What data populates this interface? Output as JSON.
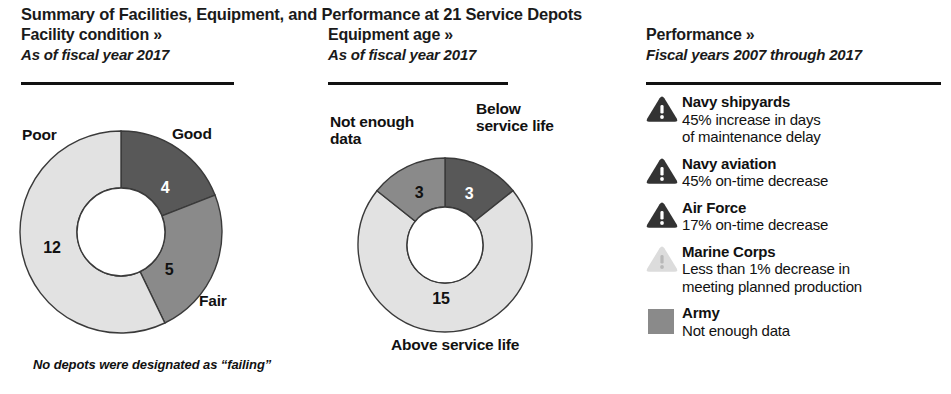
{
  "title": "Summary of Facilities, Equipment, and Performance at 21 Service Depots",
  "colors": {
    "dark": "#585858",
    "medium": "#8a8a8a",
    "light": "#e2e2e2",
    "stroke": "#3a3a3a",
    "icon_dark": "#333333",
    "icon_light": "#dcdcdc",
    "rule": "#111111",
    "text": "#111111"
  },
  "columns": {
    "facility": {
      "title": "Facility condition »",
      "subtitle": "As of fiscal year 2017",
      "footnote": "No depots were designated as “failing”"
    },
    "equipment": {
      "title": "Equipment age »",
      "subtitle": "As of fiscal year 2017"
    },
    "performance": {
      "title": "Performance »",
      "subtitle": "Fiscal years 2007 through 2017"
    }
  },
  "chart_data": [
    {
      "type": "pie",
      "id": "facility-condition",
      "title": "Facility condition »",
      "subtitle": "As of fiscal year 2017",
      "total": 21,
      "unit": "depots",
      "donut": true,
      "labels": [
        "Good",
        "Fair",
        "Poor"
      ],
      "values": [
        4,
        5,
        12
      ],
      "colors": [
        "#585858",
        "#8a8a8a",
        "#e2e2e2"
      ],
      "label_positions": [
        "top-right",
        "bottom-right",
        "top-left"
      ],
      "note": "No depots were designated as “failing”"
    },
    {
      "type": "pie",
      "id": "equipment-age",
      "title": "Equipment age »",
      "subtitle": "As of fiscal year 2017",
      "total": 21,
      "unit": "depots",
      "donut": true,
      "labels": [
        "Below service life",
        "Above service life",
        "Not enough data"
      ],
      "values": [
        3,
        15,
        3
      ],
      "colors": [
        "#585858",
        "#e2e2e2",
        "#8a8a8a"
      ],
      "label_positions": [
        "top-right",
        "bottom",
        "top-left"
      ]
    }
  ],
  "facility_slices": {
    "good": {
      "label": "Good",
      "value": "4"
    },
    "fair": {
      "label": "Fair",
      "value": "5"
    },
    "poor": {
      "label": "Poor",
      "value": "12"
    }
  },
  "equipment_slices": {
    "below": {
      "label": "Below<br>service life",
      "line1": "Below",
      "line2": "service life",
      "value": "3"
    },
    "above": {
      "label": "Above service life",
      "value": "15"
    },
    "notenough": {
      "line1": "Not enough",
      "line2": "data",
      "value": "3"
    }
  },
  "performance_items": [
    {
      "name": "Navy shipyards",
      "desc_line1": "45% increase in days",
      "desc_line2": "of maintenance delay",
      "icon": "warning-triangle-dark",
      "icon_style": "dark"
    },
    {
      "name": "Navy aviation",
      "desc_line1": "45% on-time decrease",
      "desc_line2": "",
      "icon": "warning-triangle-dark",
      "icon_style": "dark"
    },
    {
      "name": "Air Force",
      "desc_line1": "17% on-time decrease",
      "desc_line2": "",
      "icon": "warning-triangle-dark",
      "icon_style": "dark"
    },
    {
      "name": "Marine Corps",
      "desc_line1": "Less than 1% decrease in",
      "desc_line2": "meeting planned production",
      "icon": "warning-triangle-light",
      "icon_style": "light"
    },
    {
      "name": "Army",
      "desc_line1": "Not enough data",
      "desc_line2": "",
      "icon": "gray-square-swatch",
      "icon_style": "swatch"
    }
  ]
}
